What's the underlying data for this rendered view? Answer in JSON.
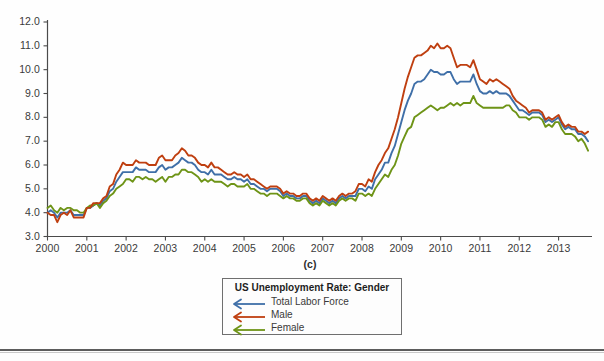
{
  "panel_caption": "(c)",
  "legend": {
    "title": "US Unemployment Rate: Gender",
    "entries": [
      {
        "label": "Total Labor Force",
        "color": "#3f6fa8",
        "marker": "left-arrow-line"
      },
      {
        "label": "Male",
        "color": "#bf3f10",
        "marker": "left-arrow-line"
      },
      {
        "label": "Female",
        "color": "#6e9417",
        "marker": "left-arrow-line"
      }
    ]
  },
  "chart_data": {
    "type": "line",
    "title": "US Unemployment Rate: Gender",
    "xlabel": "",
    "ylabel": "",
    "xlim": [
      2000,
      2013.85
    ],
    "ylim": [
      3.0,
      12.0
    ],
    "grid": false,
    "legend_position": "below-center",
    "xticks": [
      2000,
      2001,
      2002,
      2003,
      2004,
      2005,
      2006,
      2007,
      2008,
      2009,
      2010,
      2011,
      2012,
      2013
    ],
    "xtick_labels": [
      "2000",
      "2001",
      "2002",
      "2003",
      "2004",
      "2005",
      "2006",
      "2007",
      "2008",
      "2009",
      "2010",
      "2011",
      "2012",
      "2013"
    ],
    "yticks": [
      3.0,
      4.0,
      5.0,
      6.0,
      7.0,
      8.0,
      9.0,
      10.0,
      11.0,
      12.0
    ],
    "ytick_labels": [
      "3.0",
      "4.0",
      "5.0",
      "6.0",
      "7.0",
      "8.0",
      "9.0",
      "10.0",
      "11.0",
      "12.0"
    ],
    "x": [
      2000.0,
      2000.083,
      2000.167,
      2000.25,
      2000.333,
      2000.417,
      2000.5,
      2000.583,
      2000.667,
      2000.75,
      2000.833,
      2000.917,
      2001.0,
      2001.083,
      2001.167,
      2001.25,
      2001.333,
      2001.417,
      2001.5,
      2001.583,
      2001.667,
      2001.75,
      2001.833,
      2001.917,
      2002.0,
      2002.083,
      2002.167,
      2002.25,
      2002.333,
      2002.417,
      2002.5,
      2002.583,
      2002.667,
      2002.75,
      2002.833,
      2002.917,
      2003.0,
      2003.083,
      2003.167,
      2003.25,
      2003.333,
      2003.417,
      2003.5,
      2003.583,
      2003.667,
      2003.75,
      2003.833,
      2003.917,
      2004.0,
      2004.083,
      2004.167,
      2004.25,
      2004.333,
      2004.417,
      2004.5,
      2004.583,
      2004.667,
      2004.75,
      2004.833,
      2004.917,
      2005.0,
      2005.083,
      2005.167,
      2005.25,
      2005.333,
      2005.417,
      2005.5,
      2005.583,
      2005.667,
      2005.75,
      2005.833,
      2005.917,
      2006.0,
      2006.083,
      2006.167,
      2006.25,
      2006.333,
      2006.417,
      2006.5,
      2006.583,
      2006.667,
      2006.75,
      2006.833,
      2006.917,
      2007.0,
      2007.083,
      2007.167,
      2007.25,
      2007.333,
      2007.417,
      2007.5,
      2007.583,
      2007.667,
      2007.75,
      2007.833,
      2007.917,
      2008.0,
      2008.083,
      2008.167,
      2008.25,
      2008.333,
      2008.417,
      2008.5,
      2008.583,
      2008.667,
      2008.75,
      2008.833,
      2008.917,
      2009.0,
      2009.083,
      2009.167,
      2009.25,
      2009.333,
      2009.417,
      2009.5,
      2009.583,
      2009.667,
      2009.75,
      2009.833,
      2009.917,
      2010.0,
      2010.083,
      2010.167,
      2010.25,
      2010.333,
      2010.417,
      2010.5,
      2010.583,
      2010.667,
      2010.75,
      2010.833,
      2010.917,
      2011.0,
      2011.083,
      2011.167,
      2011.25,
      2011.333,
      2011.417,
      2011.5,
      2011.583,
      2011.667,
      2011.75,
      2011.833,
      2011.917,
      2012.0,
      2012.083,
      2012.167,
      2012.25,
      2012.333,
      2012.417,
      2012.5,
      2012.583,
      2012.667,
      2012.75,
      2012.833,
      2012.917,
      2013.0,
      2013.083,
      2013.167,
      2013.25,
      2013.333,
      2013.417,
      2013.5,
      2013.583,
      2013.667,
      2013.75
    ],
    "series": [
      {
        "name": "Total Labor Force",
        "color": "#3f6fa8",
        "values": [
          4.0,
          4.1,
          4.0,
          3.8,
          4.0,
          4.0,
          4.0,
          4.1,
          3.9,
          3.9,
          3.9,
          3.9,
          4.2,
          4.2,
          4.3,
          4.4,
          4.3,
          4.5,
          4.6,
          4.9,
          5.0,
          5.3,
          5.5,
          5.7,
          5.7,
          5.7,
          5.7,
          5.9,
          5.8,
          5.8,
          5.8,
          5.7,
          5.7,
          5.7,
          5.9,
          6.0,
          5.8,
          5.9,
          5.9,
          6.0,
          6.1,
          6.3,
          6.2,
          6.1,
          6.1,
          6.0,
          5.8,
          5.7,
          5.7,
          5.6,
          5.8,
          5.6,
          5.6,
          5.6,
          5.5,
          5.4,
          5.4,
          5.5,
          5.4,
          5.4,
          5.3,
          5.4,
          5.2,
          5.2,
          5.1,
          5.0,
          5.0,
          4.9,
          5.0,
          5.0,
          5.0,
          4.9,
          4.7,
          4.8,
          4.7,
          4.7,
          4.6,
          4.6,
          4.7,
          4.7,
          4.5,
          4.4,
          4.5,
          4.4,
          4.6,
          4.5,
          4.4,
          4.5,
          4.4,
          4.6,
          4.7,
          4.6,
          4.7,
          4.7,
          4.7,
          5.0,
          5.0,
          4.9,
          5.1,
          5.0,
          5.4,
          5.6,
          5.8,
          6.1,
          6.1,
          6.5,
          6.8,
          7.3,
          7.8,
          8.3,
          8.7,
          9.0,
          9.4,
          9.5,
          9.5,
          9.6,
          9.8,
          10.0,
          9.9,
          9.9,
          9.8,
          9.8,
          9.9,
          9.9,
          9.6,
          9.4,
          9.5,
          9.5,
          9.5,
          9.5,
          9.8,
          9.4,
          9.1,
          9.0,
          9.0,
          9.1,
          9.0,
          9.1,
          9.0,
          9.0,
          9.0,
          8.9,
          8.7,
          8.5,
          8.3,
          8.3,
          8.2,
          8.1,
          8.2,
          8.2,
          8.2,
          8.1,
          7.8,
          7.9,
          7.8,
          7.9,
          8.0,
          7.7,
          7.5,
          7.6,
          7.5,
          7.5,
          7.3,
          7.3,
          7.2,
          7.0
        ]
      },
      {
        "name": "Male",
        "color": "#bf3f10",
        "values": [
          4.0,
          3.9,
          3.9,
          3.6,
          3.9,
          4.0,
          3.9,
          4.1,
          3.8,
          3.8,
          3.8,
          3.8,
          4.2,
          4.2,
          4.4,
          4.4,
          4.4,
          4.6,
          4.7,
          5.1,
          5.2,
          5.6,
          5.8,
          6.1,
          6.0,
          6.0,
          6.0,
          6.2,
          6.1,
          6.1,
          6.1,
          6.0,
          6.0,
          6.0,
          6.3,
          6.4,
          6.2,
          6.2,
          6.2,
          6.4,
          6.5,
          6.7,
          6.6,
          6.4,
          6.4,
          6.3,
          6.1,
          6.0,
          6.0,
          5.9,
          6.1,
          5.9,
          5.9,
          5.8,
          5.7,
          5.6,
          5.6,
          5.7,
          5.6,
          5.6,
          5.5,
          5.6,
          5.4,
          5.4,
          5.3,
          5.2,
          5.1,
          5.0,
          5.1,
          5.1,
          5.1,
          5.0,
          4.8,
          4.9,
          4.8,
          4.8,
          4.7,
          4.7,
          4.8,
          4.8,
          4.6,
          4.5,
          4.6,
          4.5,
          4.7,
          4.6,
          4.5,
          4.6,
          4.5,
          4.7,
          4.8,
          4.7,
          4.8,
          4.8,
          4.9,
          5.2,
          5.2,
          5.1,
          5.4,
          5.3,
          5.7,
          6.0,
          6.2,
          6.5,
          6.7,
          7.1,
          7.5,
          8.0,
          8.6,
          9.2,
          9.7,
          10.1,
          10.5,
          10.6,
          10.6,
          10.7,
          10.8,
          11.0,
          10.9,
          11.1,
          10.9,
          10.9,
          11.0,
          10.9,
          10.5,
          10.1,
          10.2,
          10.2,
          10.2,
          10.1,
          10.4,
          10.0,
          9.6,
          9.5,
          9.4,
          9.6,
          9.5,
          9.6,
          9.5,
          9.4,
          9.3,
          9.2,
          8.9,
          8.7,
          8.6,
          8.5,
          8.4,
          8.2,
          8.3,
          8.3,
          8.3,
          8.2,
          7.9,
          8.0,
          7.9,
          8.0,
          8.1,
          7.8,
          7.6,
          7.7,
          7.6,
          7.6,
          7.4,
          7.4,
          7.3,
          7.4
        ]
      },
      {
        "name": "Female",
        "color": "#6e9417",
        "values": [
          4.2,
          4.3,
          4.1,
          4.0,
          4.2,
          4.1,
          4.2,
          4.2,
          4.1,
          4.1,
          4.0,
          4.0,
          4.2,
          4.3,
          4.3,
          4.4,
          4.2,
          4.4,
          4.5,
          4.7,
          4.8,
          5.0,
          5.1,
          5.2,
          5.4,
          5.4,
          5.3,
          5.5,
          5.5,
          5.4,
          5.5,
          5.4,
          5.4,
          5.3,
          5.4,
          5.5,
          5.3,
          5.5,
          5.5,
          5.6,
          5.6,
          5.8,
          5.8,
          5.7,
          5.7,
          5.6,
          5.5,
          5.3,
          5.4,
          5.3,
          5.4,
          5.3,
          5.3,
          5.3,
          5.2,
          5.1,
          5.2,
          5.2,
          5.1,
          5.1,
          5.1,
          5.2,
          5.0,
          5.0,
          4.9,
          4.8,
          4.8,
          4.7,
          4.8,
          4.8,
          4.8,
          4.7,
          4.6,
          4.7,
          4.6,
          4.6,
          4.5,
          4.5,
          4.6,
          4.6,
          4.4,
          4.3,
          4.4,
          4.3,
          4.5,
          4.4,
          4.3,
          4.4,
          4.3,
          4.5,
          4.6,
          4.5,
          4.6,
          4.6,
          4.5,
          4.8,
          4.8,
          4.7,
          4.8,
          4.7,
          5.0,
          5.2,
          5.4,
          5.6,
          5.5,
          5.8,
          6.0,
          6.4,
          6.9,
          7.2,
          7.5,
          7.6,
          8.0,
          8.1,
          8.2,
          8.3,
          8.4,
          8.5,
          8.4,
          8.3,
          8.4,
          8.4,
          8.5,
          8.6,
          8.5,
          8.6,
          8.5,
          8.6,
          8.6,
          8.6,
          8.9,
          8.6,
          8.5,
          8.4,
          8.4,
          8.4,
          8.4,
          8.4,
          8.4,
          8.4,
          8.5,
          8.5,
          8.3,
          8.2,
          8.0,
          8.0,
          8.0,
          7.9,
          8.0,
          8.0,
          8.0,
          7.9,
          7.6,
          7.7,
          7.6,
          7.8,
          7.8,
          7.5,
          7.3,
          7.3,
          7.3,
          7.2,
          7.0,
          7.1,
          6.9,
          6.6
        ]
      }
    ]
  },
  "axes": {
    "y_labels": [
      "12.0",
      "11.0",
      "10.0",
      "9.0",
      "8.0",
      "7.0",
      "6.0",
      "5.0",
      "4.0",
      "3.0"
    ],
    "x_labels": [
      "2000",
      "2001",
      "2002",
      "2003",
      "2004",
      "2005",
      "2006",
      "2007",
      "2008",
      "2009",
      "2010",
      "2011",
      "2012",
      "2013"
    ]
  }
}
